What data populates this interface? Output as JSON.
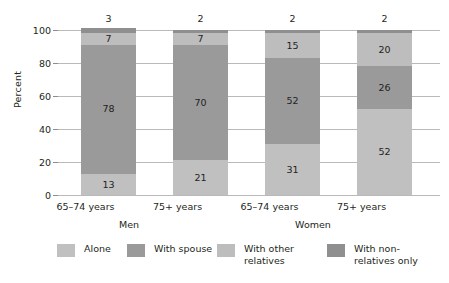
{
  "chart_data": {
    "type": "bar",
    "subtype": "stacked-percent",
    "title": "",
    "xlabel": "",
    "ylabel": "Percent",
    "ylim": [
      0,
      100
    ],
    "yticks": [
      0,
      20,
      40,
      60,
      80,
      100
    ],
    "grid": true,
    "legend_position": "bottom",
    "categories": [
      "65–74 years",
      "75+ years",
      "65–74 years",
      "75+ years"
    ],
    "groups": [
      {
        "label": "Men",
        "categories": [
          "65–74 years",
          "75+ years"
        ]
      },
      {
        "label": "Women",
        "categories": [
          "65–74 years",
          "75+ years"
        ]
      }
    ],
    "series": [
      {
        "name": "Alone",
        "color": "#c0c0c0",
        "values": [
          13,
          21,
          31,
          52
        ]
      },
      {
        "name": "With spouse",
        "color": "#9a9a9a",
        "values": [
          78,
          70,
          52,
          26
        ]
      },
      {
        "name": "With other\nrelatives",
        "color": "#bdbdbd",
        "values": [
          7,
          7,
          15,
          20
        ]
      },
      {
        "name": "With non-\nrelatives only",
        "color": "#8f8f8f",
        "values": [
          3,
          2,
          2,
          2
        ]
      }
    ],
    "bars": [
      {
        "category": "65–74 years",
        "group": "Men",
        "total_label": "3",
        "segments": [
          {
            "series": "Alone",
            "value": 13,
            "label": "13",
            "label_visible": true
          },
          {
            "series": "With spouse",
            "value": 78,
            "label": "78",
            "label_visible": true
          },
          {
            "series": "With other relatives",
            "value": 7,
            "label": "7",
            "label_visible": true
          },
          {
            "series": "With non-relatives only",
            "value": 3,
            "label": "3",
            "label_visible": false
          }
        ]
      },
      {
        "category": "75+ years",
        "group": "Men",
        "total_label": "2",
        "segments": [
          {
            "series": "Alone",
            "value": 21,
            "label": "21",
            "label_visible": true
          },
          {
            "series": "With spouse",
            "value": 70,
            "label": "70",
            "label_visible": true
          },
          {
            "series": "With other relatives",
            "value": 7,
            "label": "7",
            "label_visible": true
          },
          {
            "series": "With non-relatives only",
            "value": 2,
            "label": "2",
            "label_visible": false
          }
        ]
      },
      {
        "category": "65–74 years",
        "group": "Women",
        "total_label": "2",
        "segments": [
          {
            "series": "Alone",
            "value": 31,
            "label": "31",
            "label_visible": true
          },
          {
            "series": "With spouse",
            "value": 52,
            "label": "52",
            "label_visible": true
          },
          {
            "series": "With other relatives",
            "value": 15,
            "label": "15",
            "label_visible": true
          },
          {
            "series": "With non-relatives only",
            "value": 2,
            "label": "2",
            "label_visible": false
          }
        ]
      },
      {
        "category": "75+ years",
        "group": "Women",
        "total_label": "2",
        "segments": [
          {
            "series": "Alone",
            "value": 52,
            "label": "52",
            "label_visible": true
          },
          {
            "series": "With spouse",
            "value": 26,
            "label": "26",
            "label_visible": true
          },
          {
            "series": "With other relatives",
            "value": 20,
            "label": "20",
            "label_visible": true
          },
          {
            "series": "With non-relatives only",
            "value": 2,
            "label": "2",
            "label_visible": false
          }
        ]
      }
    ]
  },
  "axis": {
    "y_title": "Percent",
    "y_tick_labels": [
      "0",
      "20",
      "40",
      "60",
      "80",
      "100"
    ]
  },
  "x_labels": {
    "cat_0": "65–74 years",
    "cat_1": "75+ years",
    "cat_2": "65–74 years",
    "cat_3": "75+ years",
    "group_0": "Men",
    "group_1": "Women"
  },
  "bar_totals": {
    "bar_0": "3",
    "bar_1": "2",
    "bar_2": "2",
    "bar_3": "2"
  },
  "legend": {
    "items": [
      {
        "label": "Alone",
        "color": "#c0c0c0"
      },
      {
        "label": "With spouse",
        "color": "#9a9a9a"
      },
      {
        "label": "With other\nrelatives",
        "color": "#bdbdbd"
      },
      {
        "label": "With non-\nrelatives only",
        "color": "#8f8f8f"
      }
    ]
  },
  "colors": {
    "alone": "#c0c0c0",
    "with_spouse": "#9a9a9a",
    "with_other_relatives": "#bdbdbd",
    "with_non_relatives_only": "#8f8f8f",
    "grid": "#b9b9b9",
    "axis": "#8d8d8d",
    "text": "#231f20",
    "background": "#ffffff"
  }
}
